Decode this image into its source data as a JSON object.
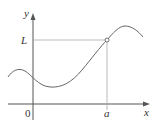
{
  "diagram": {
    "type": "function-limit-graph",
    "axes": {
      "x_label": "x",
      "y_label": "y",
      "origin_label": "0"
    },
    "markers": {
      "x_tick_label": "a",
      "y_tick_label": "L"
    },
    "point": {
      "style": "open-circle",
      "at": [
        "a",
        "L"
      ]
    },
    "colors": {
      "axis": "#555555",
      "curve": "#666666",
      "guide": "#aaaaaa"
    }
  }
}
